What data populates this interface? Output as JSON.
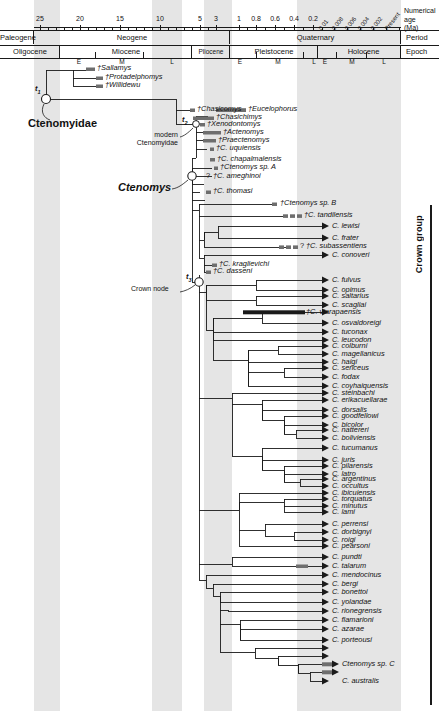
{
  "figure": {
    "type": "phylogenetic-time-tree",
    "axis_caption_line1": "Numerical age",
    "axis_caption_line2": "(Ma)",
    "row_label_period": "Period",
    "row_label_epoch": "Epoch",
    "crown_group_label": "Crown group",
    "crown_node_label": "Crown node",
    "family_label": "Ctenomyidae",
    "genus_label": "Ctenomys",
    "modern_label_line1": "modern",
    "modern_label_line2": "Ctenomyidae",
    "node_t1": "t",
    "node_t1_sub": "1",
    "node_t2": "t",
    "node_t2_sub": "2",
    "node_t3": "t",
    "node_t3_sub": "3"
  },
  "timescale": {
    "ticks_linear": [
      {
        "label": "25",
        "ma": 25
      },
      {
        "label": "20",
        "ma": 20
      },
      {
        "label": "15",
        "ma": 15
      },
      {
        "label": "10",
        "ma": 10
      },
      {
        "label": "5",
        "ma": 5
      },
      {
        "label": "3",
        "ma": 3
      },
      {
        "label": "1",
        "ma": 1
      },
      {
        "label": "0.8",
        "ma": 0.8
      },
      {
        "label": "0.6",
        "ma": 0.6
      },
      {
        "label": "0.4",
        "ma": 0.4
      },
      {
        "label": "0.2",
        "ma": 0.2
      }
    ],
    "ticks_rotated": [
      {
        "label": "0.01"
      },
      {
        "label": "0.008"
      },
      {
        "label": "0.006"
      },
      {
        "label": "0.004"
      },
      {
        "label": "0.002"
      },
      {
        "label": "Present"
      }
    ],
    "periods": [
      {
        "name": "Paleogene"
      },
      {
        "name": "Neogene"
      },
      {
        "name": "Quaternary"
      }
    ],
    "epochs": [
      {
        "name": "Oligocene",
        "subs": []
      },
      {
        "name": "Miocene",
        "subs": [
          "E",
          "M",
          "L"
        ]
      },
      {
        "name": "Pliocene",
        "subs": []
      },
      {
        "name": "Pleistocene",
        "subs": [
          "E",
          "M",
          "L"
        ]
      },
      {
        "name": "Holocene",
        "subs": [
          "E",
          "M",
          "L"
        ]
      }
    ]
  },
  "taxa": {
    "fossil_stem": [
      {
        "name": "†Sallamys"
      },
      {
        "name": "†Protadelphomys"
      },
      {
        "name": "†Willidewu"
      },
      {
        "name": "†Chasicomys"
      },
      {
        "name": "†Chasichimys"
      },
      {
        "name": "†Eucelophorus"
      },
      {
        "name": "†Xenodontomys"
      },
      {
        "name": "†Actenomys"
      },
      {
        "name": "†Praectenomys"
      }
    ],
    "fossil_ctenomys": [
      {
        "name": "†C. uquiensis"
      },
      {
        "name": "†C. chapalmalensis"
      },
      {
        "name": "†Ctenomys sp. A"
      },
      {
        "name": "†C. ameghinoi",
        "query": "?"
      },
      {
        "name": "†C. thomasi"
      },
      {
        "name": "†Ctenomys sp. B"
      },
      {
        "name": "†C. tandilensis"
      },
      {
        "name": "†C. subassentiens",
        "query": "?"
      },
      {
        "name": "†C. kraglievichi"
      },
      {
        "name": "†C. dasseni"
      }
    ],
    "crown_tips": [
      {
        "name": "C. lewisi",
        "extinct": false
      },
      {
        "name": "C. frater",
        "extinct": false
      },
      {
        "name": "C. conoveri",
        "extinct": false
      },
      {
        "name": "C. fulvus",
        "extinct": false
      },
      {
        "name": "C. opimus",
        "extinct": false
      },
      {
        "name": "C. saltarius",
        "extinct": false
      },
      {
        "name": "C. scagliai",
        "extinct": false
      },
      {
        "name": "†C. viarapaensis",
        "extinct": true
      },
      {
        "name": "C. osvaldoreigi",
        "extinct": false
      },
      {
        "name": "C. tuconax",
        "extinct": false
      },
      {
        "name": "C. leucodon",
        "extinct": false
      },
      {
        "name": "C. colburni",
        "extinct": false
      },
      {
        "name": "C. magellanicus",
        "extinct": false
      },
      {
        "name": "C. haigi",
        "extinct": false
      },
      {
        "name": "C. sericeus",
        "extinct": false
      },
      {
        "name": "C. fodax",
        "extinct": false
      },
      {
        "name": "C. coyhaiquensis",
        "extinct": false
      },
      {
        "name": "C. steinbachi",
        "extinct": false
      },
      {
        "name": "C. erikacuellarae",
        "extinct": false
      },
      {
        "name": "C. dorsalis",
        "extinct": false
      },
      {
        "name": "C. goodfellowi",
        "extinct": false
      },
      {
        "name": "C. bicolor",
        "extinct": false
      },
      {
        "name": "C. nattereri",
        "extinct": false
      },
      {
        "name": "C. boliviensis",
        "extinct": false
      },
      {
        "name": "C. tucumanus",
        "extinct": false
      },
      {
        "name": "C. juris",
        "extinct": false
      },
      {
        "name": "C. pilarensis",
        "extinct": false
      },
      {
        "name": "C. latro",
        "extinct": false
      },
      {
        "name": "C. argentinus",
        "extinct": false
      },
      {
        "name": "C. occultus",
        "extinct": false
      },
      {
        "name": "C. ibicuiensis",
        "extinct": false
      },
      {
        "name": "C. torquatus",
        "extinct": false
      },
      {
        "name": "C. minutus",
        "extinct": false
      },
      {
        "name": "C. lami",
        "extinct": false
      },
      {
        "name": "C. perrensi",
        "extinct": false
      },
      {
        "name": "C. dorbignyi",
        "extinct": false
      },
      {
        "name": "C. roigi",
        "extinct": false
      },
      {
        "name": "C. pearsoni",
        "extinct": false
      },
      {
        "name": "C. pundti",
        "extinct": false
      },
      {
        "name": "C. talarum",
        "extinct": false
      },
      {
        "name": "C. mendocinus",
        "extinct": false
      },
      {
        "name": "C. bergi",
        "extinct": false
      },
      {
        "name": "C. bonettoi",
        "extinct": false
      },
      {
        "name": "C. yolandae",
        "extinct": false
      },
      {
        "name": "C. rionegrensis",
        "extinct": false
      },
      {
        "name": "C. flamarioni",
        "extinct": false
      },
      {
        "name": "C. azarae",
        "extinct": false
      },
      {
        "name": "C. porteousi",
        "extinct": false
      },
      {
        "name": "Ctenomys sp. C",
        "extinct": false
      },
      {
        "name": "C. australis",
        "extinct": false
      }
    ]
  },
  "colors": {
    "line": "#1a1a1a",
    "band": "#dcdcdc",
    "bar": "#6e6e6e"
  }
}
